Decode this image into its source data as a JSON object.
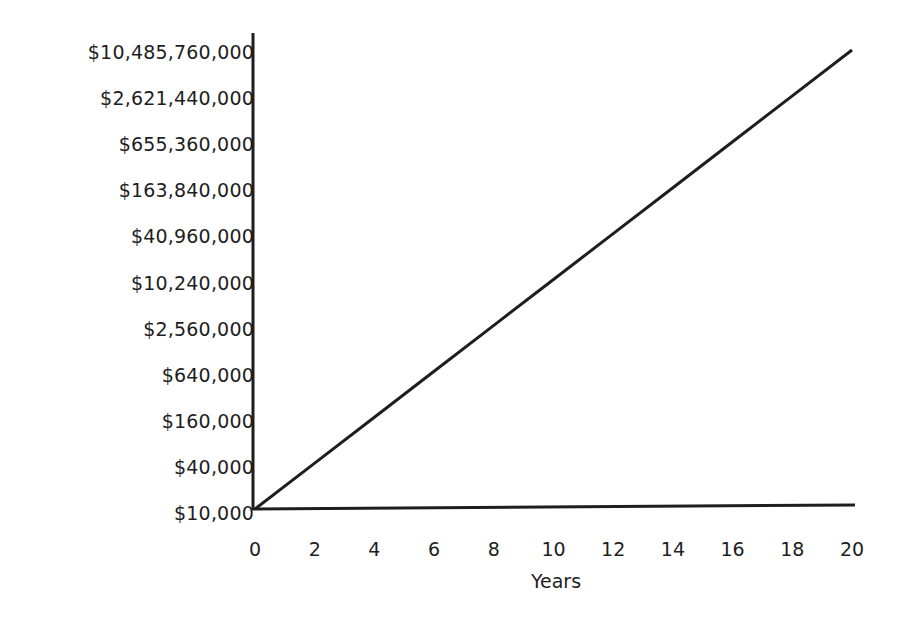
{
  "chart_data": {
    "type": "line",
    "title": "",
    "xlabel": "Years",
    "ylabel": "",
    "y_scale": "log4",
    "x_ticks": [
      0,
      2,
      4,
      6,
      8,
      10,
      12,
      14,
      16,
      18,
      20
    ],
    "x_tick_labels": [
      "0",
      "2",
      "4",
      "6",
      "8",
      "10",
      "12",
      "14",
      "16",
      "18",
      "20"
    ],
    "y_tick_labels": [
      "$10,000",
      "$40,000",
      "$160,000",
      "$640,000",
      "$2,560,000",
      "$10,240,000",
      "$40,960,000",
      "$163,840,000",
      "$655,360,000",
      "$2,621,440,000",
      "$10,485,760,000"
    ],
    "y_tick_values": [
      10000,
      40000,
      160000,
      640000,
      2560000,
      10240000,
      40960000,
      163840000,
      655360000,
      2621440000,
      10485760000
    ],
    "xlim": [
      0,
      20
    ],
    "ylim": [
      10000,
      10485760000
    ],
    "grid": false,
    "legend": null,
    "series": [
      {
        "name": "Value",
        "color": "#1e1e1e",
        "x": [
          0,
          2,
          4,
          6,
          8,
          10,
          12,
          14,
          16,
          18,
          20
        ],
        "values": [
          10000,
          40000,
          160000,
          640000,
          2560000,
          10240000,
          40960000,
          163840000,
          655360000,
          2621440000,
          10485760000
        ]
      }
    ]
  },
  "colors": {
    "axis": "#1e1e1e",
    "line": "#1e1e1e",
    "background": "#ffffff"
  }
}
